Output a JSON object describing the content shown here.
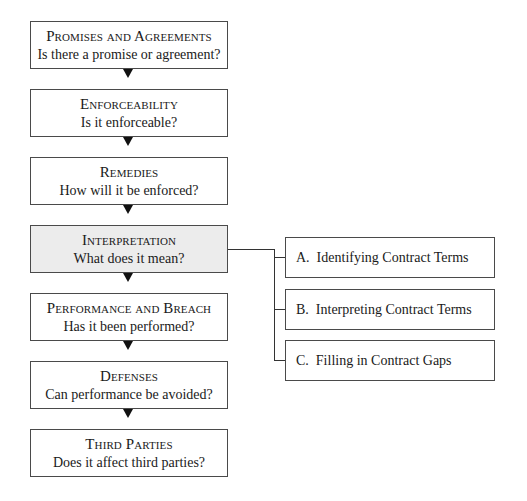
{
  "diagram": {
    "steps": [
      {
        "title": "Promises and Agreements",
        "question": "Is there a promise or agreement?"
      },
      {
        "title": "Enforceability",
        "question": "Is it enforceable?"
      },
      {
        "title": "Remedies",
        "question": "How will it be enforced?"
      },
      {
        "title": "Interpretation",
        "question": "What does it mean?",
        "highlighted": true
      },
      {
        "title": "Performance and Breach",
        "question": "Has it been performed?"
      },
      {
        "title": "Defenses",
        "question": "Can performance be avoided?"
      },
      {
        "title": "Third Parties",
        "question": "Does it affect third parties?"
      }
    ],
    "interpretation_subtopics": [
      {
        "label": "A.  Identifying Contract Terms"
      },
      {
        "label": "B.  Interpreting Contract Terms"
      },
      {
        "label": "C.  Filling in Contract Gaps"
      }
    ],
    "colors": {
      "highlight_fill": "#ececec",
      "border": "#4a4a4a",
      "arrow": "#111111"
    }
  }
}
